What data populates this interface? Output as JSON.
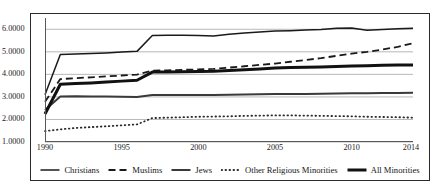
{
  "chart_data": {
    "type": "line",
    "title": "",
    "xlabel": "",
    "ylabel": "",
    "xlim": [
      1990,
      2014
    ],
    "ylim": [
      1.0,
      6.5
    ],
    "ytick_labels": [
      "1.0000",
      "2.0000",
      "3.0000",
      "4.0000",
      "5.0000",
      "6.0000"
    ],
    "ytick_values": [
      1.0,
      2.0,
      3.0,
      4.0,
      5.0,
      6.0
    ],
    "xtick_labels": [
      "1990",
      "1995",
      "2000",
      "2005",
      "2010",
      "2014"
    ],
    "xtick_values": [
      1990,
      1995,
      2000,
      2005,
      2010,
      2014
    ],
    "grid": "horizontal",
    "legend_position": "bottom",
    "x": [
      1990,
      1991,
      1992,
      1993,
      1994,
      1995,
      1996,
      1997,
      1998,
      1999,
      2000,
      2001,
      2002,
      2003,
      2004,
      2005,
      2006,
      2007,
      2008,
      2009,
      2010,
      2011,
      2012,
      2013,
      2014
    ],
    "series": [
      {
        "name": "Christians",
        "style": "solid-thin",
        "color": "#1a1a1a",
        "values": [
          3.1,
          4.88,
          4.9,
          4.92,
          4.95,
          4.99,
          5.02,
          5.72,
          5.73,
          5.73,
          5.72,
          5.7,
          5.78,
          5.84,
          5.88,
          5.92,
          5.94,
          5.97,
          5.99,
          6.04,
          6.06,
          5.96,
          5.99,
          6.02,
          6.04
        ]
      },
      {
        "name": "Muslims",
        "style": "dashed",
        "color": "#1a1a1a",
        "values": [
          2.78,
          3.79,
          3.83,
          3.87,
          3.91,
          3.95,
          3.99,
          4.16,
          4.18,
          4.2,
          4.22,
          4.24,
          4.3,
          4.36,
          4.42,
          4.48,
          4.56,
          4.64,
          4.72,
          4.82,
          4.92,
          5.0,
          5.1,
          5.22,
          5.38
        ]
      },
      {
        "name": "Jews",
        "style": "solid-medium",
        "color": "#3a3a3a",
        "values": [
          2.42,
          3.02,
          3.03,
          3.02,
          3.02,
          3.01,
          3.0,
          3.08,
          3.09,
          3.09,
          3.09,
          3.09,
          3.1,
          3.11,
          3.12,
          3.13,
          3.13,
          3.13,
          3.14,
          3.15,
          3.16,
          3.16,
          3.17,
          3.17,
          3.18
        ]
      },
      {
        "name": "Other Religious Minorities",
        "style": "dotted",
        "color": "#2a2a2a",
        "values": [
          1.48,
          1.56,
          1.62,
          1.66,
          1.7,
          1.74,
          1.78,
          2.06,
          2.08,
          2.1,
          2.12,
          2.13,
          2.14,
          2.16,
          2.17,
          2.18,
          2.18,
          2.17,
          2.16,
          2.15,
          2.14,
          2.12,
          2.11,
          2.1,
          2.08
        ]
      },
      {
        "name": "All Minorities",
        "style": "solid-thick",
        "color": "#111111",
        "values": [
          2.24,
          3.56,
          3.59,
          3.62,
          3.66,
          3.7,
          3.74,
          4.1,
          4.11,
          4.12,
          4.13,
          4.14,
          4.17,
          4.2,
          4.24,
          4.28,
          4.3,
          4.32,
          4.33,
          4.35,
          4.37,
          4.38,
          4.4,
          4.41,
          4.42
        ]
      }
    ]
  },
  "legend": {
    "items": [
      {
        "label": "Christians",
        "icon": "solid-thin-line-icon"
      },
      {
        "label": "Muslims",
        "icon": "dashed-line-icon"
      },
      {
        "label": "Jews",
        "icon": "solid-medium-line-icon"
      },
      {
        "label": "Other Religious Minorities",
        "icon": "dotted-line-icon"
      },
      {
        "label": "All Minorities",
        "icon": "solid-thick-line-icon"
      }
    ]
  }
}
